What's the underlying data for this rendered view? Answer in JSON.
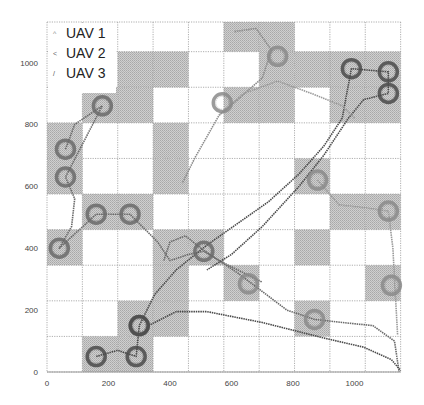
{
  "chart_data": {
    "type": "scatter",
    "title": "",
    "xlabel": "",
    "ylabel": "",
    "xlim": [
      0,
      1150
    ],
    "ylim": [
      0,
      1130
    ],
    "x_ticks": [
      0,
      200,
      400,
      600,
      800,
      1000
    ],
    "y_ticks": [
      0,
      200,
      400,
      600,
      800,
      1000
    ],
    "x_tick_labels": [
      "0",
      "200",
      "400",
      "600",
      "800",
      "1000"
    ],
    "y_tick_labels": [
      "0",
      "200",
      "400",
      "600",
      "800",
      "1000"
    ],
    "grid": {
      "on": true,
      "style": "dotted",
      "columns": 10,
      "rows": 10,
      "cell_size": 115,
      "shaded_cells_row_col_top_down": [
        [
          0,
          5
        ],
        [
          0,
          6
        ],
        [
          1,
          2
        ],
        [
          1,
          3
        ],
        [
          1,
          6
        ],
        [
          1,
          7
        ],
        [
          1,
          8
        ],
        [
          1,
          9
        ],
        [
          2,
          1
        ],
        [
          2,
          2
        ],
        [
          2,
          5
        ],
        [
          2,
          6
        ],
        [
          2,
          8
        ],
        [
          2,
          9
        ],
        [
          3,
          0
        ],
        [
          3,
          3
        ],
        [
          4,
          0
        ],
        [
          4,
          3
        ],
        [
          4,
          7
        ],
        [
          5,
          1
        ],
        [
          5,
          2
        ],
        [
          5,
          8
        ],
        [
          5,
          9
        ],
        [
          6,
          0
        ],
        [
          6,
          3
        ],
        [
          6,
          4
        ],
        [
          6,
          7
        ],
        [
          7,
          3
        ],
        [
          7,
          5
        ],
        [
          7,
          9
        ],
        [
          8,
          2
        ],
        [
          8,
          3
        ],
        [
          8,
          7
        ],
        [
          9,
          1
        ],
        [
          9,
          2
        ]
      ]
    },
    "legend": {
      "position": "upper-left",
      "entries": [
        "UAV 1",
        "UAV 2",
        "UAV 3"
      ]
    },
    "series": [
      {
        "name": "UAV 1",
        "color": "#8a8a8a",
        "loiter_circles": [
          [
            570,
            870
          ],
          [
            750,
            1020
          ],
          [
            880,
            620
          ],
          [
            1110,
            520
          ],
          [
            1120,
            280
          ],
          [
            870,
            170
          ],
          [
            655,
            285
          ]
        ],
        "path": [
          [
            610,
            1100
          ],
          [
            680,
            1110
          ],
          [
            730,
            1040
          ],
          [
            700,
            950
          ],
          [
            620,
            880
          ],
          [
            560,
            830
          ],
          [
            520,
            760
          ],
          [
            480,
            690
          ],
          [
            440,
            610
          ]
        ]
      },
      {
        "name": "UAV 2",
        "color": "#6a6a6a",
        "loiter_circles": [
          [
            60,
            720
          ],
          [
            60,
            630
          ],
          [
            180,
            860
          ],
          [
            40,
            400
          ],
          [
            160,
            510
          ],
          [
            270,
            510
          ],
          [
            510,
            390
          ],
          [
            300,
            150
          ]
        ],
        "path": [
          [
            60,
            720
          ],
          [
            90,
            800
          ],
          [
            180,
            860
          ],
          [
            60,
            630
          ],
          [
            90,
            560
          ],
          [
            80,
            470
          ],
          [
            40,
            400
          ],
          [
            160,
            510
          ],
          [
            270,
            510
          ],
          [
            360,
            420
          ],
          [
            400,
            360
          ],
          [
            460,
            380
          ],
          [
            510,
            390
          ],
          [
            560,
            360
          ],
          [
            620,
            320
          ],
          [
            700,
            260
          ],
          [
            780,
            200
          ],
          [
            870,
            170
          ],
          [
            960,
            160
          ],
          [
            1060,
            150
          ],
          [
            1130,
            100
          ],
          [
            1145,
            0
          ]
        ]
      },
      {
        "name": "UAV 3",
        "color": "#4a4a4a",
        "loiter_circles": [
          [
            160,
            50
          ],
          [
            290,
            50
          ],
          [
            300,
            150
          ],
          [
            990,
            980
          ],
          [
            1110,
            970
          ],
          [
            1110,
            900
          ]
        ],
        "path": [
          [
            160,
            50
          ],
          [
            230,
            70
          ],
          [
            290,
            50
          ],
          [
            300,
            150
          ],
          [
            350,
            250
          ],
          [
            420,
            330
          ],
          [
            520,
            410
          ],
          [
            620,
            480
          ],
          [
            720,
            550
          ],
          [
            820,
            640
          ],
          [
            900,
            730
          ],
          [
            960,
            820
          ],
          [
            990,
            980
          ],
          [
            1110,
            970
          ],
          [
            1110,
            900
          ],
          [
            1030,
            880
          ],
          [
            980,
            820
          ],
          [
            900,
            700
          ],
          [
            820,
            600
          ],
          [
            700,
            470
          ],
          [
            600,
            380
          ],
          [
            520,
            330
          ]
        ]
      }
    ],
    "extra_paths": [
      {
        "name": "UAV 3 return arc",
        "color": "#4a4a4a",
        "points": [
          [
            330,
            150
          ],
          [
            420,
            195
          ],
          [
            520,
            195
          ],
          [
            700,
            160
          ],
          [
            900,
            110
          ],
          [
            1030,
            80
          ],
          [
            1120,
            40
          ],
          [
            1150,
            5
          ]
        ]
      },
      {
        "name": "UAV 1 mid arc",
        "color": "#9a9a9a",
        "points": [
          [
            560,
            830
          ],
          [
            640,
            900
          ],
          [
            750,
            940
          ],
          [
            860,
            900
          ],
          [
            960,
            860
          ],
          [
            1000,
            820
          ]
        ]
      },
      {
        "name": "UAV 1 right arc",
        "color": "#9a9a9a",
        "points": [
          [
            880,
            620
          ],
          [
            950,
            540
          ],
          [
            1040,
            530
          ],
          [
            1110,
            520
          ],
          [
            1125,
            400
          ],
          [
            1130,
            300
          ],
          [
            1140,
            120
          ]
        ]
      },
      {
        "name": "UAV 2 cross arc",
        "color": "#6a6a6a",
        "points": [
          [
            380,
            360
          ],
          [
            400,
            420
          ],
          [
            450,
            440
          ],
          [
            500,
            400
          ],
          [
            560,
            360
          ],
          [
            620,
            330
          ],
          [
            700,
            290
          ]
        ]
      }
    ]
  }
}
